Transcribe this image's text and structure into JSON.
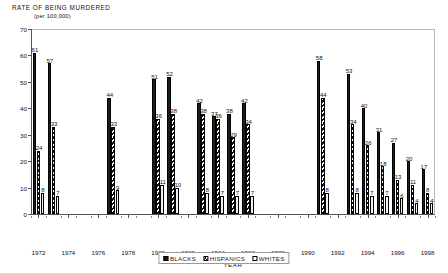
{
  "chart_data": {
    "type": "bar",
    "title": "RATE OF BEING MURDERED",
    "subtitle": "(per 100,000)",
    "xlabel": "YEAR",
    "ylabel": "",
    "ylim": [
      0,
      70
    ],
    "yticks": [
      0,
      10,
      20,
      30,
      40,
      50,
      60,
      70
    ],
    "grid": false,
    "legend_position": "bottom",
    "x": [
      1972,
      1973,
      1974,
      1975,
      1976,
      1977,
      1978,
      1979,
      1980,
      1981,
      1982,
      1983,
      1984,
      1985,
      1986,
      1987,
      1988,
      1989,
      1990,
      1991,
      1992,
      1993,
      1994,
      1995,
      1996,
      1997,
      1998
    ],
    "xtick_labels": [
      "1972",
      "1974",
      "1976",
      "1978",
      "1980",
      "1982",
      "1984",
      "1986",
      "1988",
      "1990",
      "1992",
      "1994",
      "1996",
      "1998"
    ],
    "xtick_values": [
      1972,
      1974,
      1976,
      1978,
      1980,
      1982,
      1984,
      1986,
      1988,
      1990,
      1992,
      1994,
      1996,
      1998
    ],
    "series": [
      {
        "name": "BLACKS",
        "color": "#1c1c1c",
        "fill": "solid",
        "values": [
          61,
          57,
          null,
          null,
          null,
          44,
          null,
          null,
          51,
          52,
          null,
          42,
          37,
          38,
          42,
          null,
          null,
          null,
          null,
          58,
          null,
          53,
          40,
          31,
          27,
          20,
          17
        ]
      },
      {
        "name": "HISPANICS",
        "color": "#111111",
        "fill": "hatched",
        "values": [
          24,
          33,
          null,
          null,
          null,
          33,
          null,
          null,
          36,
          38,
          null,
          38,
          36,
          29,
          34,
          null,
          null,
          null,
          null,
          44,
          null,
          34,
          26,
          18,
          13,
          11,
          8
        ]
      },
      {
        "name": "WHITES",
        "color": "#ffffff",
        "fill": "open",
        "values": [
          8,
          7,
          null,
          null,
          null,
          9,
          null,
          null,
          11,
          10,
          null,
          8,
          7,
          7,
          7,
          null,
          null,
          null,
          null,
          8,
          null,
          8,
          7,
          7,
          6,
          4,
          4
        ]
      }
    ]
  },
  "legend": {
    "items": [
      {
        "label": "BLACKS",
        "swatch": "solid-black-swatch"
      },
      {
        "label": "HISPANICS",
        "swatch": "hatched-swatch"
      },
      {
        "label": "WHITES",
        "swatch": "open-white-swatch"
      }
    ]
  }
}
